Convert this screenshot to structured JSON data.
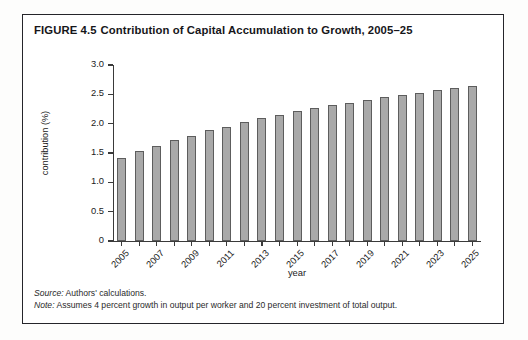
{
  "figure": {
    "number": "FIGURE 4.5",
    "title": "Contribution of Capital Accumulation to Growth, 2005–25",
    "source_lead": "Source:",
    "source_text": " Authors' calculations.",
    "note_lead": "Note:",
    "note_text": " Assumes 4 percent growth in output per worker and 20 percent investment of total output."
  },
  "chart_data": {
    "type": "bar",
    "title": "Contribution of Capital Accumulation to Growth, 2005–25",
    "xlabel": "year",
    "ylabel": "contribution (%)",
    "ylim": [
      0,
      3.0
    ],
    "ytick_labels": [
      "0",
      "0.5",
      "1.0",
      "1.5",
      "2.0",
      "2.5",
      "3.0"
    ],
    "ytick_values": [
      0,
      0.5,
      1.0,
      1.5,
      2.0,
      2.5,
      3.0
    ],
    "xtick_labels": [
      "2005",
      "2007",
      "2009",
      "2011",
      "2013",
      "2015",
      "2017",
      "2019",
      "2021",
      "2023",
      "2025"
    ],
    "grid": false,
    "legend": "none",
    "bar_color": "#a9a9a9",
    "bar_edge_color": "#5d5d5d",
    "categories": [
      "2005",
      "2006",
      "2007",
      "2008",
      "2009",
      "2010",
      "2011",
      "2012",
      "2013",
      "2014",
      "2015",
      "2016",
      "2017",
      "2018",
      "2019",
      "2020",
      "2021",
      "2022",
      "2023",
      "2024",
      "2025"
    ],
    "values": [
      1.42,
      1.53,
      1.62,
      1.72,
      1.79,
      1.89,
      1.95,
      2.03,
      2.09,
      2.15,
      2.21,
      2.26,
      2.31,
      2.36,
      2.41,
      2.45,
      2.49,
      2.53,
      2.57,
      2.61,
      2.65
    ]
  }
}
